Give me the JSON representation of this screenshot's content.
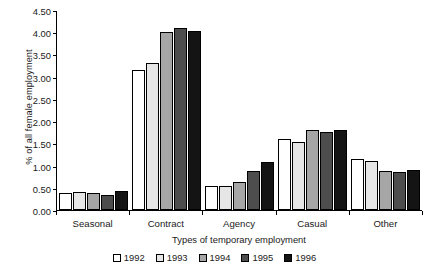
{
  "chart_data": {
    "type": "bar",
    "title": "",
    "subtitle": "",
    "xlabel": "Types of temporary employment",
    "ylabel": "% of all female employment",
    "categories": [
      "Seasonal",
      "Contract",
      "Agency",
      "Casual",
      "Other"
    ],
    "series": [
      {
        "name": "1992",
        "color": "#ffffff",
        "values": [
          0.38,
          3.15,
          0.55,
          1.6,
          1.15
        ]
      },
      {
        "name": "1993",
        "color": "#e6e6e6",
        "values": [
          0.41,
          3.3,
          0.55,
          1.53,
          1.1
        ]
      },
      {
        "name": "1994",
        "color": "#a6a6a6",
        "values": [
          0.39,
          4.0,
          0.63,
          1.8,
          0.88
        ]
      },
      {
        "name": "1995",
        "color": "#4d4d4d",
        "values": [
          0.33,
          4.1,
          0.87,
          1.75,
          0.85
        ]
      },
      {
        "name": "1996",
        "color": "#141414",
        "values": [
          0.43,
          4.03,
          1.08,
          1.8,
          0.9
        ]
      }
    ],
    "ylim": [
      0.0,
      4.5
    ],
    "ytick_step": 0.5,
    "yticks": [
      "0.00",
      "0.50",
      "1.00",
      "1.50",
      "2.00",
      "2.50",
      "3.00",
      "3.50",
      "4.00",
      "4.50"
    ],
    "ytick_values": [
      0.0,
      0.5,
      1.0,
      1.5,
      2.0,
      2.5,
      3.0,
      3.5,
      4.0,
      4.5
    ],
    "grid": false,
    "legend_position": "bottom",
    "bar_outline_color": "#000000"
  }
}
